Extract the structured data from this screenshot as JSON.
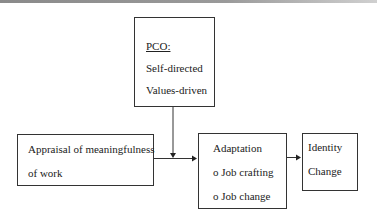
{
  "diagram": {
    "pco_box": {
      "title": "PCO:",
      "lines": [
        "Self-directed",
        "Values-driven"
      ]
    },
    "appraisal_box": {
      "lines": [
        "Appraisal of meaningfulness",
        "of work"
      ]
    },
    "adaptation_box": {
      "lines": [
        "Adaptation",
        "o Job crafting",
        "o Job change"
      ]
    },
    "identity_box": {
      "lines": [
        "Identity",
        "Change"
      ]
    },
    "edges": [
      {
        "from": "PCO",
        "to": "Appraisal-Adaptation link",
        "type": "moderator"
      },
      {
        "from": "Appraisal of meaningfulness of work",
        "to": "Adaptation"
      },
      {
        "from": "Adaptation",
        "to": "Identity Change"
      }
    ]
  }
}
